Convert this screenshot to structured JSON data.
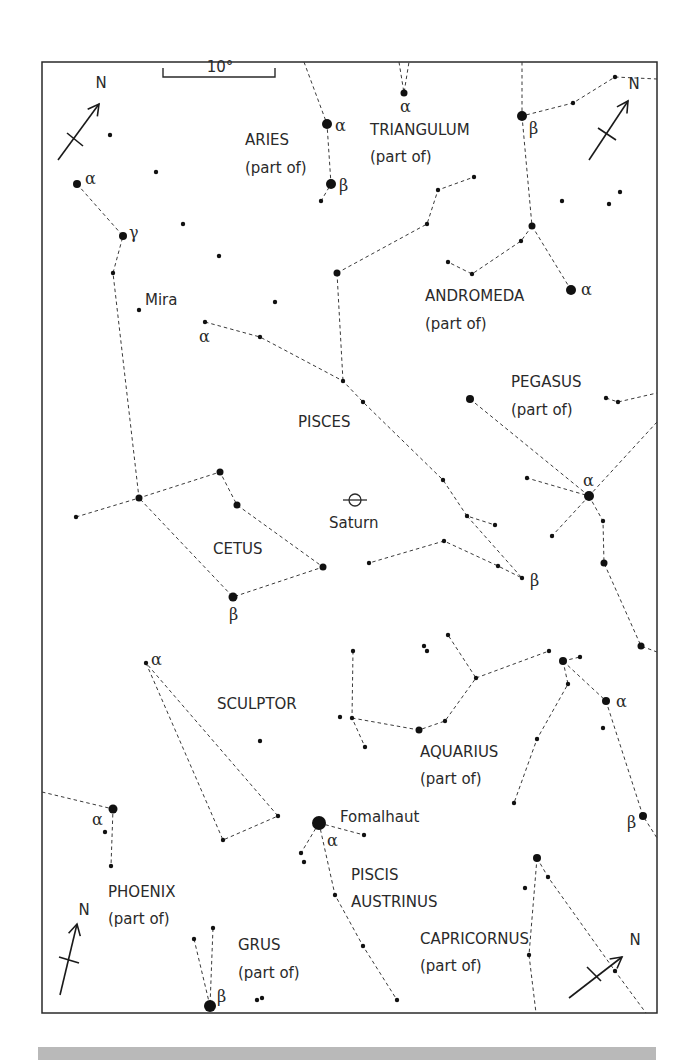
{
  "frame": {
    "x": 42,
    "y": 62,
    "w": 615,
    "h": 951
  },
  "scale_bar": {
    "label": "10°",
    "x1": 163,
    "x2": 275,
    "y": 77,
    "label_x": 220,
    "label_y": 72
  },
  "north_arrows": [
    {
      "label": "N",
      "x1": 58,
      "y1": 160,
      "x2": 99,
      "y2": 104,
      "tick": [
        [
          67,
          133
        ],
        [
          83,
          146
        ]
      ],
      "label_x": 101,
      "label_y": 88
    },
    {
      "label": "N",
      "x1": 589,
      "y1": 160,
      "x2": 628,
      "y2": 101,
      "tick": [
        [
          598,
          128
        ],
        [
          616,
          140
        ]
      ],
      "label_x": 634,
      "label_y": 89
    },
    {
      "label": "N",
      "x1": 60,
      "y1": 995,
      "x2": 77,
      "y2": 924,
      "tick": [
        [
          59,
          957
        ],
        [
          79,
          963
        ]
      ],
      "label_x": 84,
      "label_y": 915
    },
    {
      "label": "N",
      "x1": 569,
      "y1": 998,
      "x2": 622,
      "y2": 957,
      "tick": [
        [
          587,
          967
        ],
        [
          601,
          981
        ]
      ],
      "label_x": 635,
      "label_y": 945
    }
  ],
  "constellation_labels": [
    {
      "name": "ARIES",
      "x": 245,
      "y": 145
    },
    {
      "name": "(part of)",
      "x": 245,
      "y": 173
    },
    {
      "name": "TRIANGULUM",
      "x": 370,
      "y": 135
    },
    {
      "name": "(part of)",
      "x": 370,
      "y": 162
    },
    {
      "name": "ANDROMEDA",
      "x": 425,
      "y": 301
    },
    {
      "name": "(part of)",
      "x": 425,
      "y": 329
    },
    {
      "name": "PEGASUS",
      "x": 511,
      "y": 387
    },
    {
      "name": "(part of)",
      "x": 511,
      "y": 415
    },
    {
      "name": "PISCES",
      "x": 298,
      "y": 427
    },
    {
      "name": "CETUS",
      "x": 213,
      "y": 554
    },
    {
      "name": "SCULPTOR",
      "x": 217,
      "y": 709
    },
    {
      "name": "AQUARIUS",
      "x": 420,
      "y": 757
    },
    {
      "name": "(part of)",
      "x": 420,
      "y": 784
    },
    {
      "name": "PHOENIX",
      "x": 108,
      "y": 897
    },
    {
      "name": "(part of)",
      "x": 108,
      "y": 924
    },
    {
      "name": "PISCIS",
      "x": 351,
      "y": 880
    },
    {
      "name": "AUSTRINUS",
      "x": 351,
      "y": 907
    },
    {
      "name": "GRUS",
      "x": 238,
      "y": 950
    },
    {
      "name": "(part of)",
      "x": 238,
      "y": 978
    },
    {
      "name": "CAPRICORNUS",
      "x": 420,
      "y": 944
    },
    {
      "name": "(part of)",
      "x": 420,
      "y": 971
    }
  ],
  "named_objects": [
    {
      "name": "Mira",
      "x": 145,
      "y": 305
    },
    {
      "name": "Saturn",
      "x": 329,
      "y": 528
    },
    {
      "name": "Fomalhaut",
      "x": 340,
      "y": 822
    }
  ],
  "saturn_symbol": {
    "x": 355,
    "y": 500
  },
  "greek_labels": [
    {
      "text": "α",
      "x": 335,
      "y": 131
    },
    {
      "text": "β",
      "x": 339,
      "y": 191
    },
    {
      "text": "α",
      "x": 400,
      "y": 112
    },
    {
      "text": "β",
      "x": 529,
      "y": 134
    },
    {
      "text": "α",
      "x": 85,
      "y": 184
    },
    {
      "text": "γ",
      "x": 129,
      "y": 238
    },
    {
      "text": "α",
      "x": 581,
      "y": 295
    },
    {
      "text": "α",
      "x": 199,
      "y": 342
    },
    {
      "text": "α",
      "x": 583,
      "y": 486
    },
    {
      "text": "β",
      "x": 530,
      "y": 586
    },
    {
      "text": "β",
      "x": 229,
      "y": 620
    },
    {
      "text": "α",
      "x": 151,
      "y": 665
    },
    {
      "text": "α",
      "x": 616,
      "y": 707
    },
    {
      "text": "α",
      "x": 92,
      "y": 825
    },
    {
      "text": "α",
      "x": 327,
      "y": 846
    },
    {
      "text": "β",
      "x": 627,
      "y": 828
    },
    {
      "text": "β",
      "x": 217,
      "y": 1002
    }
  ],
  "stars": [
    {
      "x": 327,
      "y": 124,
      "r": 5
    },
    {
      "x": 331,
      "y": 184,
      "r": 5
    },
    {
      "x": 321,
      "y": 201,
      "r": 2.2
    },
    {
      "x": 404,
      "y": 93,
      "r": 3.5
    },
    {
      "x": 522,
      "y": 116,
      "r": 5
    },
    {
      "x": 573,
      "y": 103,
      "r": 2.2
    },
    {
      "x": 615,
      "y": 77,
      "r": 2.2
    },
    {
      "x": 110,
      "y": 135,
      "r": 2.2
    },
    {
      "x": 77,
      "y": 184,
      "r": 4
    },
    {
      "x": 156,
      "y": 172,
      "r": 2.2
    },
    {
      "x": 123,
      "y": 236,
      "r": 4
    },
    {
      "x": 183,
      "y": 224,
      "r": 2.2
    },
    {
      "x": 113,
      "y": 273,
      "r": 2.2
    },
    {
      "x": 219,
      "y": 256,
      "r": 2.2
    },
    {
      "x": 139,
      "y": 310,
      "r": 2.2
    },
    {
      "x": 275,
      "y": 302,
      "r": 2.2
    },
    {
      "x": 205,
      "y": 322,
      "r": 2.2
    },
    {
      "x": 260,
      "y": 337,
      "r": 2.2
    },
    {
      "x": 337,
      "y": 273,
      "r": 3.5
    },
    {
      "x": 427,
      "y": 224,
      "r": 2.2
    },
    {
      "x": 438,
      "y": 190,
      "r": 2.2
    },
    {
      "x": 474,
      "y": 177,
      "r": 2.2
    },
    {
      "x": 532,
      "y": 226,
      "r": 3.5
    },
    {
      "x": 521,
      "y": 241,
      "r": 2.2
    },
    {
      "x": 472,
      "y": 274,
      "r": 2.2
    },
    {
      "x": 448,
      "y": 262,
      "r": 2.2
    },
    {
      "x": 571,
      "y": 290,
      "r": 5
    },
    {
      "x": 562,
      "y": 201,
      "r": 2.2
    },
    {
      "x": 609,
      "y": 204,
      "r": 2.2
    },
    {
      "x": 620,
      "y": 192,
      "r": 2.2
    },
    {
      "x": 343,
      "y": 381,
      "r": 2.2
    },
    {
      "x": 363,
      "y": 402,
      "r": 2.2
    },
    {
      "x": 470,
      "y": 399,
      "r": 4
    },
    {
      "x": 606,
      "y": 398,
      "r": 2.2
    },
    {
      "x": 618,
      "y": 402,
      "r": 2.2
    },
    {
      "x": 443,
      "y": 480,
      "r": 2.2
    },
    {
      "x": 527,
      "y": 478,
      "r": 2.2
    },
    {
      "x": 589,
      "y": 496,
      "r": 5
    },
    {
      "x": 552,
      "y": 536,
      "r": 2.2
    },
    {
      "x": 603,
      "y": 521,
      "r": 2.2
    },
    {
      "x": 604,
      "y": 563,
      "r": 3.5
    },
    {
      "x": 641,
      "y": 646,
      "r": 3.5
    },
    {
      "x": 467,
      "y": 516,
      "r": 2.2
    },
    {
      "x": 495,
      "y": 525,
      "r": 2.2
    },
    {
      "x": 444,
      "y": 541,
      "r": 2.2
    },
    {
      "x": 369,
      "y": 563,
      "r": 2.2
    },
    {
      "x": 498,
      "y": 566,
      "r": 2.2
    },
    {
      "x": 522,
      "y": 578,
      "r": 2.2
    },
    {
      "x": 323,
      "y": 567,
      "r": 3.5
    },
    {
      "x": 76,
      "y": 517,
      "r": 2.2
    },
    {
      "x": 139,
      "y": 498,
      "r": 3.5
    },
    {
      "x": 220,
      "y": 472,
      "r": 3.5
    },
    {
      "x": 237,
      "y": 505,
      "r": 3.5
    },
    {
      "x": 233,
      "y": 597,
      "r": 4.5
    },
    {
      "x": 146,
      "y": 663,
      "r": 2.2
    },
    {
      "x": 260,
      "y": 741,
      "r": 2.2
    },
    {
      "x": 278,
      "y": 816,
      "r": 2.2
    },
    {
      "x": 223,
      "y": 840,
      "r": 2.2
    },
    {
      "x": 113,
      "y": 809,
      "r": 4.5
    },
    {
      "x": 105,
      "y": 832,
      "r": 2.2
    },
    {
      "x": 111,
      "y": 866,
      "r": 2.2
    },
    {
      "x": 353,
      "y": 651,
      "r": 2.2
    },
    {
      "x": 424,
      "y": 646,
      "r": 2.2
    },
    {
      "x": 427,
      "y": 651,
      "r": 2.2
    },
    {
      "x": 448,
      "y": 635,
      "r": 2.2
    },
    {
      "x": 340,
      "y": 717,
      "r": 2.2
    },
    {
      "x": 352,
      "y": 718,
      "r": 2.2
    },
    {
      "x": 365,
      "y": 747,
      "r": 2.2
    },
    {
      "x": 419,
      "y": 730,
      "r": 3.5
    },
    {
      "x": 445,
      "y": 721,
      "r": 2.2
    },
    {
      "x": 476,
      "y": 678,
      "r": 2.2
    },
    {
      "x": 549,
      "y": 651,
      "r": 2.2
    },
    {
      "x": 563,
      "y": 661,
      "r": 4
    },
    {
      "x": 580,
      "y": 657,
      "r": 2.2
    },
    {
      "x": 568,
      "y": 684,
      "r": 2.2
    },
    {
      "x": 606,
      "y": 701,
      "r": 4
    },
    {
      "x": 603,
      "y": 728,
      "r": 2.2
    },
    {
      "x": 537,
      "y": 739,
      "r": 2.2
    },
    {
      "x": 514,
      "y": 803,
      "r": 2.2
    },
    {
      "x": 643,
      "y": 816,
      "r": 4
    },
    {
      "x": 319,
      "y": 823,
      "r": 7
    },
    {
      "x": 364,
      "y": 835,
      "r": 2.2
    },
    {
      "x": 301,
      "y": 853,
      "r": 2.2
    },
    {
      "x": 304,
      "y": 862,
      "r": 2.2
    },
    {
      "x": 335,
      "y": 895,
      "r": 2.2
    },
    {
      "x": 363,
      "y": 946,
      "r": 2.2
    },
    {
      "x": 397,
      "y": 1000,
      "r": 2.2
    },
    {
      "x": 537,
      "y": 858,
      "r": 4
    },
    {
      "x": 548,
      "y": 877,
      "r": 2.2
    },
    {
      "x": 525,
      "y": 888,
      "r": 2.2
    },
    {
      "x": 529,
      "y": 955,
      "r": 2.2
    },
    {
      "x": 615,
      "y": 971,
      "r": 2.2
    },
    {
      "x": 194,
      "y": 939,
      "r": 2.2
    },
    {
      "x": 213,
      "y": 928,
      "r": 2.2
    },
    {
      "x": 210,
      "y": 1006,
      "r": 6
    },
    {
      "x": 257,
      "y": 1000,
      "r": 2.2
    },
    {
      "x": 262,
      "y": 998,
      "r": 2.2
    }
  ],
  "constellation_lines": [
    [
      [
        304,
        62
      ],
      [
        327,
        124
      ],
      [
        331,
        184
      ],
      [
        321,
        201
      ]
    ],
    [
      [
        399,
        62
      ],
      [
        404,
        93
      ],
      [
        409,
        62
      ]
    ],
    [
      [
        522,
        62
      ],
      [
        522,
        116
      ],
      [
        573,
        103
      ],
      [
        615,
        77
      ],
      [
        657,
        79
      ]
    ],
    [
      [
        522,
        116
      ],
      [
        532,
        226
      ],
      [
        521,
        241
      ],
      [
        472,
        274
      ],
      [
        448,
        262
      ]
    ],
    [
      [
        532,
        226
      ],
      [
        571,
        290
      ]
    ],
    [
      [
        77,
        184
      ],
      [
        123,
        236
      ],
      [
        113,
        273
      ],
      [
        139,
        498
      ]
    ],
    [
      [
        337,
        273
      ],
      [
        427,
        224
      ],
      [
        438,
        190
      ],
      [
        474,
        177
      ]
    ],
    [
      [
        337,
        273
      ],
      [
        343,
        381
      ]
    ],
    [
      [
        205,
        322
      ],
      [
        260,
        337
      ],
      [
        343,
        381
      ],
      [
        363,
        402
      ],
      [
        443,
        480
      ],
      [
        467,
        516
      ],
      [
        495,
        525
      ]
    ],
    [
      [
        467,
        516
      ],
      [
        522,
        578
      ],
      [
        498,
        566
      ],
      [
        444,
        541
      ],
      [
        369,
        563
      ]
    ],
    [
      [
        470,
        399
      ],
      [
        589,
        496
      ]
    ],
    [
      [
        606,
        398
      ],
      [
        618,
        402
      ],
      [
        657,
        393
      ]
    ],
    [
      [
        657,
        422
      ],
      [
        589,
        496
      ],
      [
        527,
        478
      ]
    ],
    [
      [
        589,
        496
      ],
      [
        552,
        536
      ]
    ],
    [
      [
        589,
        496
      ],
      [
        603,
        521
      ],
      [
        604,
        563
      ],
      [
        641,
        646
      ],
      [
        657,
        652
      ]
    ],
    [
      [
        76,
        517
      ],
      [
        139,
        498
      ],
      [
        220,
        472
      ],
      [
        237,
        505
      ],
      [
        323,
        567
      ],
      [
        233,
        597
      ],
      [
        139,
        498
      ]
    ],
    [
      [
        146,
        663
      ],
      [
        223,
        840
      ],
      [
        278,
        816
      ],
      [
        146,
        663
      ]
    ],
    [
      [
        42,
        792
      ],
      [
        113,
        809
      ],
      [
        111,
        866
      ]
    ],
    [
      [
        353,
        651
      ],
      [
        352,
        718
      ],
      [
        365,
        747
      ]
    ],
    [
      [
        352,
        718
      ],
      [
        419,
        730
      ],
      [
        445,
        721
      ],
      [
        476,
        678
      ],
      [
        448,
        635
      ]
    ],
    [
      [
        476,
        678
      ],
      [
        549,
        651
      ]
    ],
    [
      [
        563,
        661
      ],
      [
        580,
        657
      ]
    ],
    [
      [
        563,
        661
      ],
      [
        606,
        701
      ],
      [
        643,
        816
      ],
      [
        657,
        838
      ]
    ],
    [
      [
        563,
        661
      ],
      [
        568,
        684
      ],
      [
        537,
        739
      ],
      [
        514,
        803
      ]
    ],
    [
      [
        319,
        823
      ],
      [
        364,
        835
      ]
    ],
    [
      [
        319,
        823
      ],
      [
        301,
        853
      ]
    ],
    [
      [
        319,
        823
      ],
      [
        335,
        895
      ],
      [
        363,
        946
      ],
      [
        397,
        1000
      ]
    ],
    [
      [
        537,
        858
      ],
      [
        529,
        955
      ],
      [
        536,
        1013
      ]
    ],
    [
      [
        537,
        858
      ],
      [
        548,
        877
      ],
      [
        615,
        971
      ],
      [
        646,
        1013
      ]
    ],
    [
      [
        194,
        939
      ],
      [
        210,
        1006
      ],
      [
        213,
        928
      ]
    ]
  ]
}
